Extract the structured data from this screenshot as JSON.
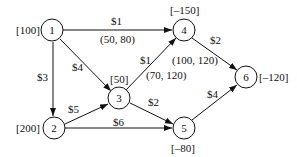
{
  "nodes": [
    {
      "id": "1",
      "label": "1",
      "supply": "[100]"
    },
    {
      "id": "2",
      "label": "2",
      "supply": "[200]"
    },
    {
      "id": "3",
      "label": "3",
      "supply": "[50]"
    },
    {
      "id": "4",
      "label": "4",
      "supply": "[–150]"
    },
    {
      "id": "5",
      "label": "5",
      "supply": "[–80]"
    },
    {
      "id": "6",
      "label": "6",
      "supply": "[–120]"
    }
  ],
  "edges": [
    {
      "from": "1",
      "to": "4",
      "cost": "$1",
      "bounds": "(50, 80)"
    },
    {
      "from": "1",
      "to": "3",
      "cost": "$4",
      "bounds": ""
    },
    {
      "from": "1",
      "to": "2",
      "cost": "$3",
      "bounds": ""
    },
    {
      "from": "2",
      "to": "3",
      "cost": "$5",
      "bounds": ""
    },
    {
      "from": "2",
      "to": "5",
      "cost": "$6",
      "bounds": ""
    },
    {
      "from": "3",
      "to": "4",
      "cost": "$1",
      "bounds": "(70, 120)"
    },
    {
      "from": "3",
      "to": "5",
      "cost": "$2",
      "bounds": ""
    },
    {
      "from": "4",
      "to": "6",
      "cost": "$2",
      "bounds": "(100, 120)"
    },
    {
      "from": "5",
      "to": "6",
      "cost": "$4",
      "bounds": ""
    }
  ],
  "colors": {
    "stroke": "#111111",
    "background": "#ffffff"
  }
}
